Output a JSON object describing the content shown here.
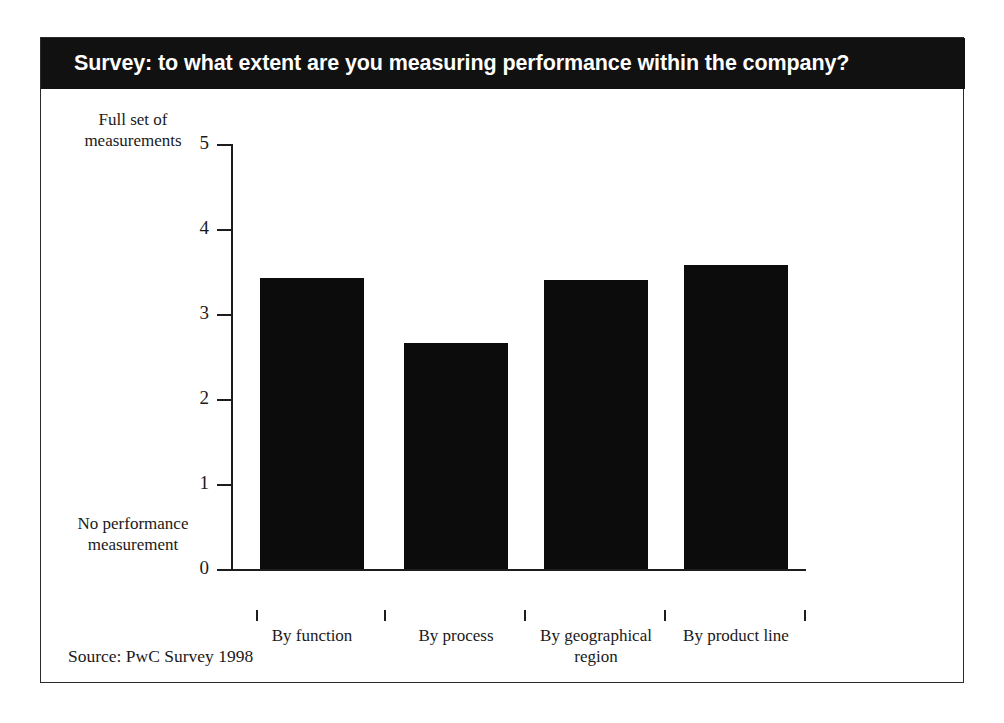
{
  "figure": {
    "title": "Survey: to what extent are you measuring performance within the company?",
    "source": "Source: PwC Survey 1998",
    "colors": {
      "banner_background": "#111111",
      "banner_text": "#ffffff",
      "bar_fill": "#0c0c0c",
      "axis": "#1d1d1d",
      "frame": "#2b2b2b",
      "page_background": "#ffffff"
    }
  },
  "chart_data": {
    "type": "bar",
    "title": "Survey: to what extent are you measuring performance within the company?",
    "categories": [
      "By function",
      "By process",
      "By geographical region",
      "By product line"
    ],
    "values": [
      3.42,
      2.66,
      3.4,
      3.58
    ],
    "xlabel": "",
    "ylabel": "",
    "ylim": [
      0,
      5
    ],
    "yticks": [
      0,
      1,
      2,
      3,
      4,
      5
    ],
    "ytick_labels": [
      "0",
      "1",
      "2",
      "3",
      "4",
      "5"
    ],
    "y_axis_top_caption": "Full set of measurements",
    "y_axis_bottom_caption": "No performance measurement",
    "grid": false,
    "legend": false,
    "source": "Source: PwC Survey 1998"
  },
  "y_captions": {
    "top_line1": "Full set of",
    "top_line2": "measurements",
    "bottom_line1": "No performance",
    "bottom_line2": "measurement"
  },
  "x_labels": [
    {
      "line1": "By function",
      "line2": ""
    },
    {
      "line1": "By process",
      "line2": ""
    },
    {
      "line1": "By geographical",
      "line2": "region"
    },
    {
      "line1": "By product line",
      "line2": ""
    }
  ]
}
